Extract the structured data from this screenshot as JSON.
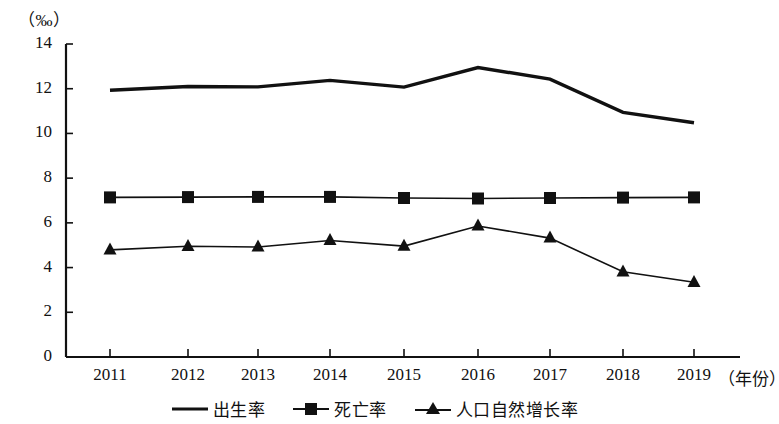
{
  "chart_data": {
    "type": "line",
    "title": "",
    "unit_label": "（‰）",
    "xlabel": "（年份）",
    "ylabel": "",
    "categories": [
      "2011",
      "2012",
      "2013",
      "2014",
      "2015",
      "2016",
      "2017",
      "2018",
      "2019"
    ],
    "x": [
      2011,
      2012,
      2013,
      2014,
      2015,
      2016,
      2017,
      2018,
      2019
    ],
    "ylim": [
      0,
      14
    ],
    "yticks": [
      0,
      2,
      4,
      6,
      8,
      10,
      12,
      14
    ],
    "grid": false,
    "legend_position": "bottom",
    "series": [
      {
        "name": "出生率",
        "marker": "none",
        "color": "#111111",
        "values": [
          11.93,
          12.1,
          12.08,
          12.37,
          12.07,
          12.95,
          12.43,
          10.94,
          10.48
        ]
      },
      {
        "name": "死亡率",
        "marker": "square",
        "color": "#111111",
        "values": [
          7.14,
          7.15,
          7.16,
          7.16,
          7.11,
          7.09,
          7.11,
          7.13,
          7.14
        ]
      },
      {
        "name": "人口自然增长率",
        "marker": "triangle",
        "color": "#111111",
        "values": [
          4.79,
          4.95,
          4.92,
          5.21,
          4.96,
          5.86,
          5.32,
          3.81,
          3.34
        ]
      }
    ]
  },
  "axis": {
    "unit": "（‰）",
    "x_title": "（年份）",
    "y_tick_labels": [
      "0",
      "2",
      "4",
      "6",
      "8",
      "10",
      "12",
      "14"
    ],
    "x_tick_labels": [
      "2011",
      "2012",
      "2013",
      "2014",
      "2015",
      "2016",
      "2017",
      "2018",
      "2019"
    ]
  },
  "legend": {
    "items": [
      {
        "label": "出生率",
        "marker": "line"
      },
      {
        "label": "死亡率",
        "marker": "square"
      },
      {
        "label": "人口自然增长率",
        "marker": "triangle"
      }
    ]
  }
}
